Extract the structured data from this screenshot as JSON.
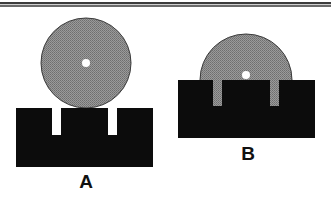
{
  "figure": {
    "colors": {
      "background": "#ffffff",
      "block": "#0c0c0c",
      "disc": "#8a8a8a",
      "disc_outline": "#3a3a3a",
      "hole": "#ffffff",
      "rule": "#555555"
    },
    "panels": [
      {
        "id": "A",
        "label": "A",
        "state": "disc resting on top of slotted block"
      },
      {
        "id": "B",
        "label": "B",
        "state": "disc lowered into block, slots filled"
      }
    ]
  }
}
